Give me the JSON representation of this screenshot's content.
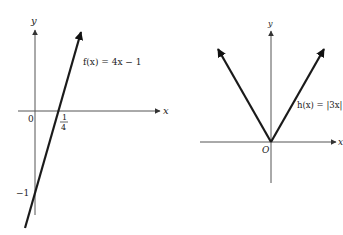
{
  "left_graph": {
    "function_label": "f(x) = 4x − 1",
    "x_axis_label": "x",
    "y_axis_label": "y",
    "origin_label": "0",
    "x_intercept_num": "1",
    "x_intercept_den": "4",
    "y_intercept_label": "−1"
  },
  "right_graph": {
    "function_label": "h(x) = |3x|",
    "x_axis_label": "x",
    "y_axis_label": "y",
    "origin_label": "O"
  },
  "colors": {
    "axis": "#555555",
    "graph_line": "#1a1a1a"
  }
}
